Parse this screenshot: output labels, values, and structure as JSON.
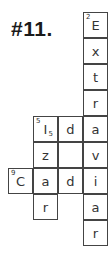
{
  "title": "#11.",
  "grid": {
    "origin_x": 8,
    "origin_y": 12,
    "cell_width": 25,
    "cell_height": 26,
    "border_color": "#444444",
    "cells": [
      {
        "row": 0,
        "col": 3,
        "letter": "E",
        "number": "2",
        "subscript": ""
      },
      {
        "row": 1,
        "col": 3,
        "letter": "x",
        "number": "",
        "subscript": ""
      },
      {
        "row": 2,
        "col": 3,
        "letter": "t",
        "number": "",
        "subscript": ""
      },
      {
        "row": 3,
        "col": 3,
        "letter": "r",
        "number": "",
        "subscript": ""
      },
      {
        "row": 4,
        "col": 1,
        "letter": "I",
        "number": "5",
        "subscript": "5"
      },
      {
        "row": 4,
        "col": 2,
        "letter": "d",
        "number": "",
        "subscript": ""
      },
      {
        "row": 4,
        "col": 3,
        "letter": "a",
        "number": "",
        "subscript": ""
      },
      {
        "row": 5,
        "col": 1,
        "letter": "z",
        "number": "",
        "subscript": ""
      },
      {
        "row": 5,
        "col": 2,
        "letter": "",
        "number": "",
        "subscript": ""
      },
      {
        "row": 5,
        "col": 3,
        "letter": "v",
        "number": "",
        "subscript": ""
      },
      {
        "row": 6,
        "col": 0,
        "letter": "C",
        "number": "9",
        "subscript": ""
      },
      {
        "row": 6,
        "col": 1,
        "letter": "a",
        "number": "",
        "subscript": ""
      },
      {
        "row": 6,
        "col": 2,
        "letter": "d",
        "number": "",
        "subscript": ""
      },
      {
        "row": 6,
        "col": 3,
        "letter": "i",
        "number": "",
        "subscript": ""
      },
      {
        "row": 7,
        "col": 1,
        "letter": "r",
        "number": "",
        "subscript": ""
      },
      {
        "row": 7,
        "col": 3,
        "letter": "a",
        "number": "",
        "subscript": ""
      },
      {
        "row": 8,
        "col": 3,
        "letter": "r",
        "number": "",
        "subscript": ""
      }
    ]
  }
}
